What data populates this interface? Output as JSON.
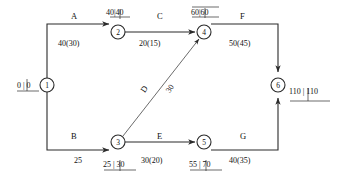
{
  "diagram": {
    "type": "activity-on-arrow-network",
    "title": "",
    "stroke_color": "#2b2b2b",
    "text_color": "#111111",
    "background": "#ffffff",
    "nodes": [
      {
        "id": "1",
        "label": "1",
        "cx": 47,
        "cy": 85,
        "r": 7
      },
      {
        "id": "2",
        "label": "2",
        "cx": 118,
        "cy": 32,
        "r": 7
      },
      {
        "id": "3",
        "label": "3",
        "cx": 118,
        "cy": 142,
        "r": 7
      },
      {
        "id": "4",
        "label": "4",
        "cx": 204,
        "cy": 32,
        "r": 7
      },
      {
        "id": "5",
        "label": "5",
        "cx": 204,
        "cy": 142,
        "r": 7
      },
      {
        "id": "6",
        "label": "6",
        "cx": 278,
        "cy": 85,
        "r": 7
      }
    ],
    "event_times": [
      {
        "node": "1",
        "early": "0",
        "late": "0",
        "text": "0 | 0",
        "position": "left"
      },
      {
        "node": "2",
        "early": "40",
        "late": "40",
        "text": "40|40",
        "position": "above"
      },
      {
        "node": "3",
        "early": "25",
        "late": "30",
        "text": "25 | 30",
        "position": "below"
      },
      {
        "node": "4",
        "early": "60",
        "late": "60",
        "text": "60|60",
        "position": "above"
      },
      {
        "node": "5",
        "early": "55",
        "late": "70",
        "text": "55 | 70",
        "position": "below"
      },
      {
        "node": "6",
        "early": "110",
        "late": "110",
        "text": "110 | 110",
        "position": "right"
      }
    ],
    "activities": [
      {
        "id": "A",
        "name": "A",
        "from": "1",
        "to": "2",
        "duration": "40(30)",
        "normal": 40,
        "crash": 30
      },
      {
        "id": "B",
        "name": "B",
        "from": "1",
        "to": "3",
        "duration": "25",
        "normal": 25,
        "crash": null
      },
      {
        "id": "C",
        "name": "C",
        "from": "2",
        "to": "4",
        "duration": "20(15)",
        "normal": 20,
        "crash": 15
      },
      {
        "id": "D",
        "name": "D",
        "from": "3",
        "to": "4",
        "duration": "30",
        "normal": 30,
        "crash": null
      },
      {
        "id": "E",
        "name": "E",
        "from": "3",
        "to": "5",
        "duration": "30(20)",
        "normal": 30,
        "crash": 20
      },
      {
        "id": "F",
        "name": "F",
        "from": "4",
        "to": "6",
        "duration": "50(45)",
        "normal": 50,
        "crash": 45
      },
      {
        "id": "G",
        "name": "G",
        "from": "5",
        "to": "6",
        "duration": "40(35)",
        "normal": 40,
        "crash": 35
      }
    ],
    "labels": {
      "act_a": "A",
      "act_b": "B",
      "act_c": "C",
      "act_d": "D",
      "act_e": "E",
      "act_f": "F",
      "act_g": "G",
      "dur_a": "40(30)",
      "dur_b": "25",
      "dur_c": "20(15)",
      "dur_d": "30",
      "dur_e": "30(20)",
      "dur_f": "50(45)",
      "dur_g": "40(35)",
      "evt_1": "0 | 0",
      "evt_2": "40|40",
      "evt_3": "25 | 30",
      "evt_4": "60|60",
      "evt_5": "55 | 70",
      "evt_6": "110 | 110",
      "node_1": "1",
      "node_2": "2",
      "node_3": "3",
      "node_4": "4",
      "node_5": "5",
      "node_6": "6"
    }
  }
}
